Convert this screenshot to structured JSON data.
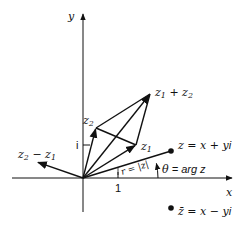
{
  "diagram": {
    "colors": {
      "stroke": "#111111",
      "background": "#ffffff"
    },
    "axes": {
      "x_label": "x",
      "y_label": "y",
      "unit_x_label": "1",
      "unit_y_label": "i"
    },
    "labels": {
      "z1_main": "z",
      "z1_sub": "1",
      "z2_main": "z",
      "z2_sub": "2",
      "sum_a": "z",
      "sum_a_sub": "1",
      "sum_plus": " + ",
      "sum_b": "z",
      "sum_b_sub": "2",
      "diff_a": "z",
      "diff_a_sub": "2",
      "diff_minus": " − ",
      "diff_b": "z",
      "diff_b_sub": "1",
      "z_point": "z = x + y",
      "z_point_i": "i",
      "modulus": "r = |z|",
      "theta": "θ",
      "argument": " = arg z",
      "conjugate": "z̄ = x − y",
      "conjugate_i": "i"
    },
    "points": {
      "origin": [
        83,
        178
      ],
      "z1": [
        136,
        145
      ],
      "z2": [
        96,
        128
      ],
      "z1_plus_z2": [
        150,
        94
      ],
      "z2_minus_z1": [
        37,
        162
      ],
      "z": [
        171,
        151
      ],
      "z_conjugate": [
        171,
        208
      ]
    }
  }
}
